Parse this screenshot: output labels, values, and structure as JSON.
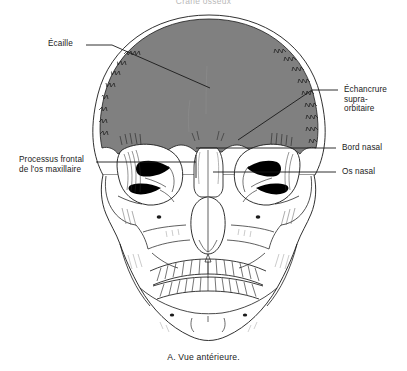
{
  "figure": {
    "title": "Crâne osseux",
    "caption": "A. Vue antérieure.",
    "view": "anterior skull",
    "colors": {
      "frontal_bone_fill": "#808080",
      "outline": "#1a1a1a",
      "page_background": "#ffffff",
      "dark_fissure": "#000000",
      "title_text": "#b9b9b9"
    }
  },
  "labels": {
    "ecaille": {
      "text": "Écaille",
      "side": "left",
      "lines": [
        "Écaille"
      ]
    },
    "processus_frontal": {
      "text": "Processus frontal de l'os maxillaire",
      "side": "left",
      "lines": [
        "Processus frontal",
        "de l'os maxillaire"
      ],
      "line1": "Processus frontal",
      "line2": "de l'os maxillaire"
    },
    "echancrure": {
      "text": "Échancrure supra-orbitaire",
      "side": "right",
      "lines": [
        "Échancrure",
        "supra-",
        "orbitaire"
      ],
      "line1": "Échancrure",
      "line2": "supra-",
      "line3": "orbitaire"
    },
    "bord_nasal": {
      "text": "Bord nasal",
      "side": "right",
      "lines": [
        "Bord nasal"
      ]
    },
    "os_nasal": {
      "text": "Os nasal",
      "side": "right",
      "lines": [
        "Os nasal"
      ]
    }
  }
}
